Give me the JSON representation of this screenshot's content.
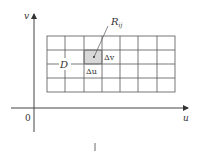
{
  "diagram": {
    "axes": {
      "origin_label": "0",
      "x_label": "u",
      "y_label": "v"
    },
    "region_label": "D",
    "cell_label": "R",
    "cell_subscript": "ij",
    "delta_u_label": "Δu",
    "delta_v_label": "Δv",
    "grid": {
      "columns": 7,
      "rows": 4
    },
    "colors": {
      "line": "#555555",
      "shade": "#d8d8d8"
    }
  }
}
